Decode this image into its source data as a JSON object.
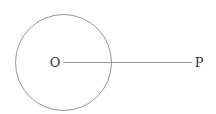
{
  "diagram": {
    "type": "geometry",
    "circle": {
      "cx": 63.5,
      "cy": 62.5,
      "r": 48,
      "stroke": "#8a8a8a"
    },
    "segment": {
      "x1": 63.5,
      "y1": 62.5,
      "x2": 192,
      "y2": 62.5,
      "stroke": "#8a8a8a"
    },
    "points": [
      {
        "label": "O",
        "x": 55,
        "y": 67
      },
      {
        "label": "P",
        "x": 199,
        "y": 67
      }
    ]
  }
}
